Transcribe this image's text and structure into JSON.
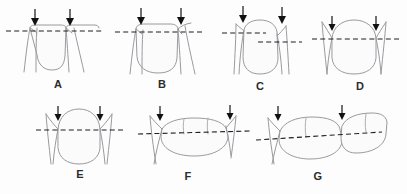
{
  "figure": {
    "background_color": "#fdfdfd",
    "line_color": "#9a9a9e",
    "dash_color": "#1f1f1f",
    "arrow_color": "#111111",
    "shade_color": "#f3f3f5"
  },
  "panels": [
    {
      "id": "A",
      "label": "A",
      "view": "anterior",
      "arrow_count": 2,
      "dash_lines": 1,
      "description": "Two adjacent anterior teeth, incisal contact at a single level reference line"
    },
    {
      "id": "B",
      "label": "B",
      "view": "anterior",
      "arrow_count": 2,
      "dash_lines": 1,
      "description": "Two anterior teeth with contact points on a single level reference line"
    },
    {
      "id": "C",
      "label": "C",
      "view": "anterior",
      "arrow_count": 2,
      "dash_lines": 2,
      "description": "Contact points at two different heights, shown by two offset dashed lines"
    },
    {
      "id": "D",
      "label": "D",
      "view": "anterior",
      "arrow_count": 2,
      "dash_lines": 1,
      "description": "Rounded crown with bilateral contact points on one reference line"
    },
    {
      "id": "E",
      "label": "E",
      "view": "anterior",
      "arrow_count": 2,
      "dash_lines": 1,
      "description": "Broad rounded crown, contact points level on a single dashed line"
    },
    {
      "id": "F",
      "label": "F",
      "view": "buccal",
      "arrow_count": 2,
      "dash_lines": 1,
      "description": "Posterior buccal view, premolar and molar contact points on one dashed line"
    },
    {
      "id": "G",
      "label": "G",
      "view": "buccal",
      "arrow_count": 2,
      "dash_lines": 1,
      "description": "Posterior buccal view of molar segment with two contact point arrows"
    }
  ]
}
